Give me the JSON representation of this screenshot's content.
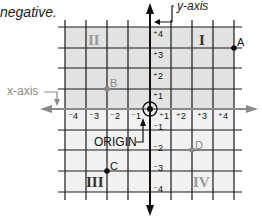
{
  "caption": "negative.",
  "axes": {
    "x_label": "x-axis",
    "y_label": "y-axis",
    "origin_label": "ORIGIN",
    "x_ticks": [
      "⁻4",
      "⁻3",
      "⁻2",
      "⁻1",
      "⁺1",
      "⁺2",
      "⁺3",
      "⁺4"
    ],
    "y_ticks_pos": [
      "⁺4",
      "⁺3",
      "⁺2",
      "⁺1"
    ],
    "y_ticks_neg": [
      "⁻1",
      "⁻2",
      "⁻3",
      "⁻4"
    ]
  },
  "quadrants": {
    "I": "I",
    "II": "II",
    "III": "III",
    "IV": "IV"
  },
  "points": [
    {
      "name": "A",
      "x": 4,
      "y": 3,
      "color": "#111111"
    },
    {
      "name": "B",
      "x": -2,
      "y": 1,
      "color": "#8a8a8a"
    },
    {
      "name": "C",
      "x": -2,
      "y": -3,
      "color": "#111111"
    },
    {
      "name": "D",
      "x": 2,
      "y": -2,
      "color": "#8a8a8a"
    }
  ],
  "colors": {
    "upper_shade": "#e2e2e2",
    "lower_shade": "#f1f1f1",
    "grid": "#1a1a1a",
    "gray_text": "#8a8a8a"
  }
}
